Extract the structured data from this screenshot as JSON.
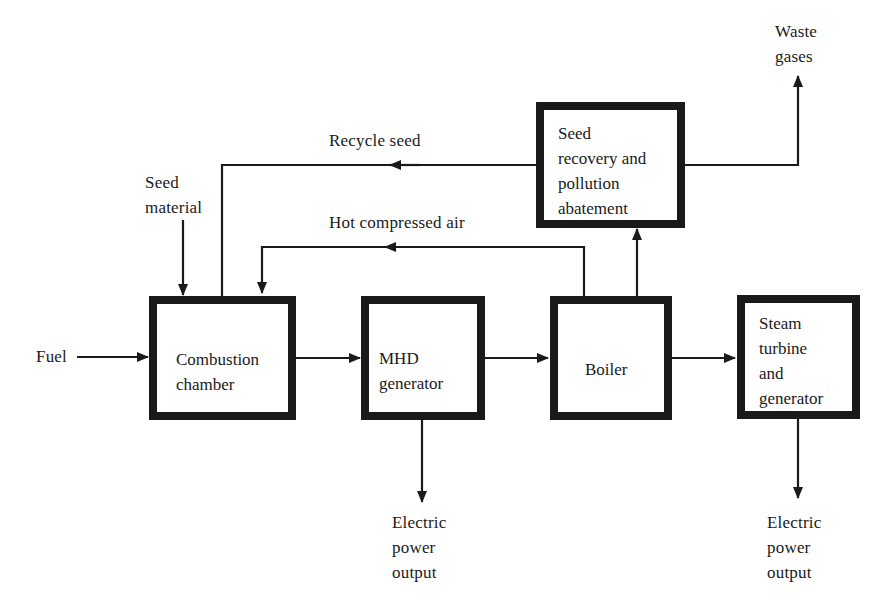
{
  "diagram": {
    "type": "flowchart",
    "blocks": {
      "combustion": {
        "line1": "Combustion",
        "line2": "chamber"
      },
      "mhd": {
        "line1": "MHD",
        "line2": "generator"
      },
      "boiler": {
        "line1": "Boiler"
      },
      "steam": {
        "line1": "Steam",
        "line2": "turbine",
        "line3": "and",
        "line4": "generator"
      },
      "seed_recovery": {
        "line1": "Seed",
        "line2": "recovery and",
        "line3": "pollution",
        "line4": "abatement"
      }
    },
    "labels": {
      "fuel": "Fuel",
      "seed_material": {
        "line1": "Seed",
        "line2": "material"
      },
      "recycle_seed": "Recycle seed",
      "hot_air": "Hot compressed air",
      "waste_gases": {
        "line1": "Waste",
        "line2": "gases"
      },
      "mhd_output": {
        "line1": "Electric",
        "line2": "power",
        "line3": "output"
      },
      "steam_output": {
        "line1": "Electric",
        "line2": "power",
        "line3": "output"
      }
    },
    "edges": [
      {
        "from": "Fuel",
        "to": "Combustion chamber"
      },
      {
        "from": "Seed material",
        "to": "Combustion chamber"
      },
      {
        "from": "Seed recovery and pollution abatement",
        "to": "Combustion chamber",
        "label": "Recycle seed"
      },
      {
        "from": "Boiler",
        "to": "Combustion chamber",
        "label": "Hot compressed air"
      },
      {
        "from": "Combustion chamber",
        "to": "MHD generator"
      },
      {
        "from": "MHD generator",
        "to": "Boiler"
      },
      {
        "from": "MHD generator",
        "to": "Electric power output"
      },
      {
        "from": "Boiler",
        "to": "Steam turbine and generator"
      },
      {
        "from": "Boiler",
        "to": "Seed recovery and pollution abatement"
      },
      {
        "from": "Seed recovery and pollution abatement",
        "to": "Waste gases"
      },
      {
        "from": "Steam turbine and generator",
        "to": "Electric power output"
      }
    ],
    "colors": {
      "ink": "#1a1a1a",
      "background": "#ffffff"
    }
  }
}
